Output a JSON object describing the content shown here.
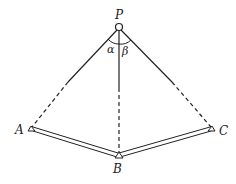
{
  "diagram": {
    "type": "geometry-figure",
    "points": {
      "P": {
        "label": "P",
        "x": 119,
        "y": 27
      },
      "A": {
        "label": "A",
        "x": 31,
        "y": 129
      },
      "B": {
        "label": "B",
        "x": 118,
        "y": 156
      },
      "C": {
        "label": "C",
        "x": 212,
        "y": 129
      }
    },
    "angles": {
      "alpha": {
        "label": "α"
      },
      "beta": {
        "label": "β"
      }
    },
    "colors": {
      "stroke": "#222222",
      "background": "#ffffff"
    }
  }
}
